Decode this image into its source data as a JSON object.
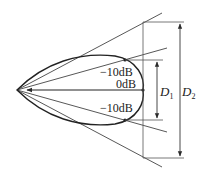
{
  "diagram": {
    "type": "directivity-pattern-beamwidth",
    "labels": {
      "upper_minus10": "−10dB",
      "zero": "0dB",
      "lower_minus10": "−10dB",
      "d1_main": "D",
      "d1_sub": "1",
      "d2_main": "D",
      "d2_sub": "2"
    },
    "colors": {
      "stroke": "#2a2a2a",
      "thin": "#555555",
      "background": "#ffffff"
    }
  }
}
